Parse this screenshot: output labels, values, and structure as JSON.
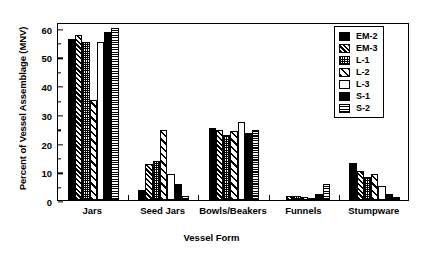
{
  "chart_data": {
    "type": "bar",
    "title": "",
    "xlabel": "Vessel Form",
    "ylabel": "Percent of Vessel Assemblage (MNV)",
    "categories": [
      "Jars",
      "Seed Jars",
      "Bowls/Beakers",
      "Funnels",
      "Stumpware"
    ],
    "ylim": [
      0,
      62
    ],
    "yticks": [
      0,
      10,
      20,
      30,
      40,
      50,
      60
    ],
    "ytick_labels": [
      "0",
      "10",
      "20",
      "30",
      "40",
      "50",
      "60"
    ],
    "grid": false,
    "legend_position": "top-right",
    "series": [
      {
        "name": "EM-2",
        "pattern": "solid-black",
        "values": [
          56.0,
          3.5,
          25.0,
          0.0,
          13.0
        ]
      },
      {
        "name": "EM-3",
        "pattern": "diagonal-hatch",
        "values": [
          57.5,
          12.5,
          24.5,
          1.5,
          10.0
        ]
      },
      {
        "name": "L-1",
        "pattern": "fine-dot",
        "values": [
          55.0,
          13.5,
          22.5,
          1.5,
          8.0
        ]
      },
      {
        "name": "L-2",
        "pattern": "wide-diagonal",
        "values": [
          35.0,
          24.5,
          24.0,
          1.0,
          9.0
        ]
      },
      {
        "name": "L-3",
        "pattern": "white",
        "values": [
          55.0,
          9.0,
          27.0,
          0.5,
          5.0
        ]
      },
      {
        "name": "S-1",
        "pattern": "solid-black",
        "values": [
          58.5,
          5.5,
          23.5,
          2.0,
          2.0
        ]
      },
      {
        "name": "S-2",
        "pattern": "horizontal-hatch",
        "values": [
          60.0,
          1.5,
          24.5,
          5.5,
          1.0
        ]
      }
    ]
  },
  "axis": {
    "y_title": "Percent of Vessel Assemblage (MNV)",
    "x_title": "Vessel Form"
  },
  "legend": {
    "items": [
      {
        "label": "EM-2"
      },
      {
        "label": "EM-3"
      },
      {
        "label": "L-1"
      },
      {
        "label": "L-2"
      },
      {
        "label": "L-3"
      },
      {
        "label": "S-1"
      },
      {
        "label": "S-2"
      }
    ]
  }
}
